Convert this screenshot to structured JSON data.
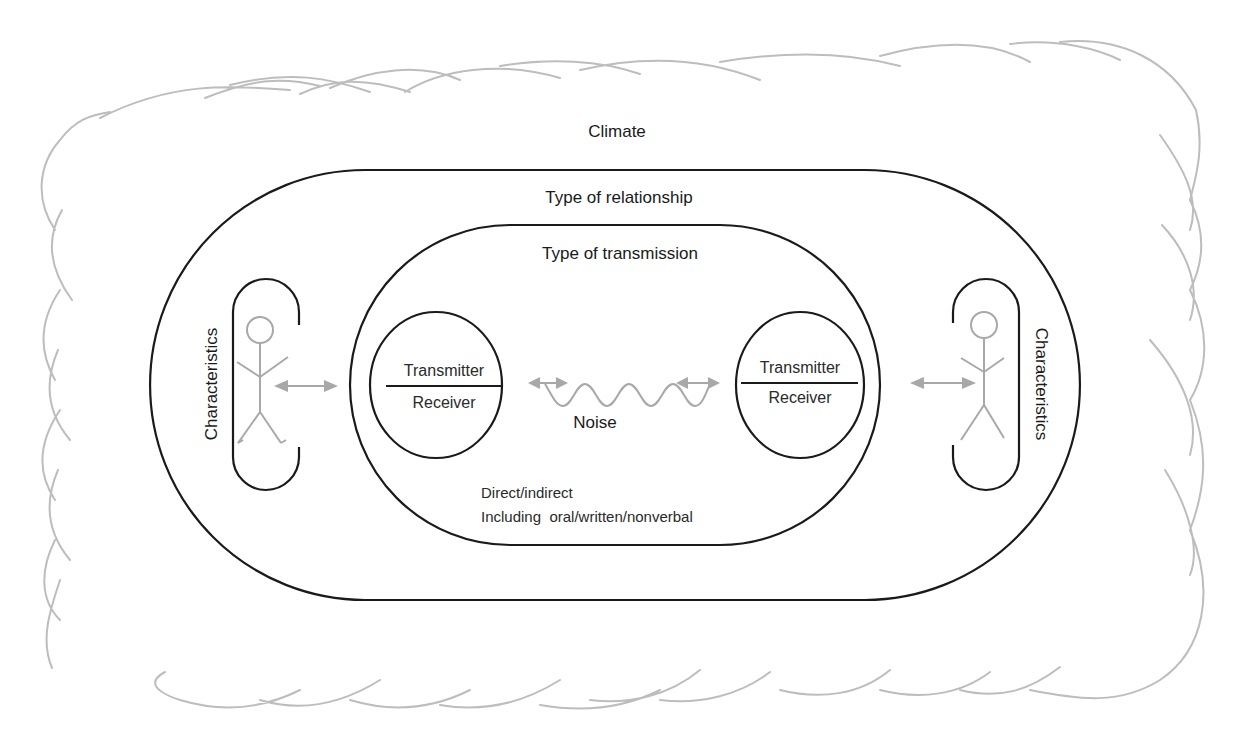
{
  "diagram": {
    "layers": {
      "climate": "Climate",
      "relationship": "Type of relationship",
      "transmission": "Type of transmission"
    },
    "left_person": {
      "label": "Characteristics"
    },
    "right_person": {
      "label": "Characteristics"
    },
    "left_node": {
      "top": "Transmitter",
      "bottom": "Receiver"
    },
    "right_node": {
      "top": "Transmitter",
      "bottom": "Receiver"
    },
    "noise": "Noise",
    "transmission_notes": {
      "line1": "Direct/indirect",
      "line2": "Including  oral/written/nonverbal"
    },
    "colors": {
      "stroke": "#1a1a1a",
      "gray": "#a8a8a8",
      "cloud": "#bdbdbd"
    }
  }
}
